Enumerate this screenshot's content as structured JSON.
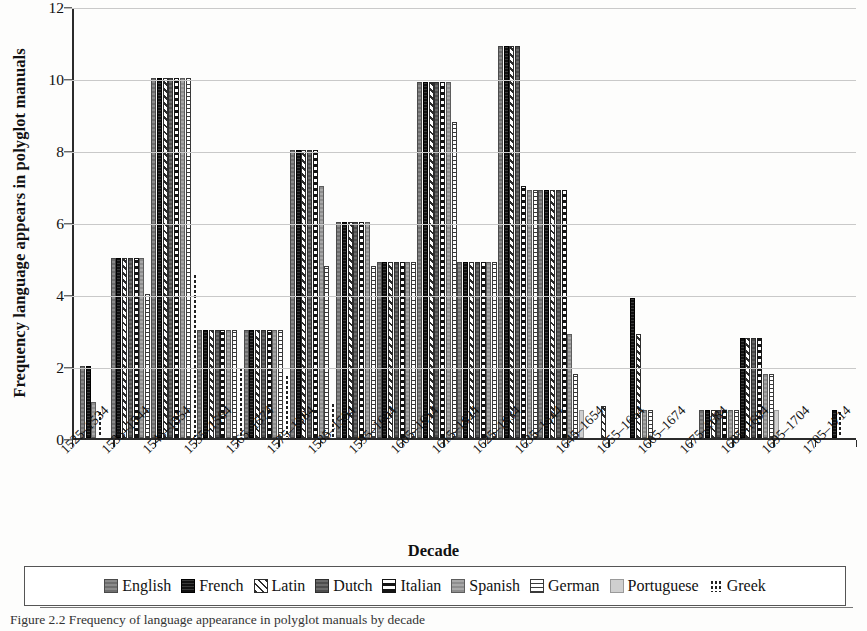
{
  "figure": {
    "caption": "Figure 2.2 Frequency of language appearance in polyglot manuals by decade",
    "xaxis_title": "Decade",
    "yaxis_title": "Frequency language appears in polyglot manuals"
  },
  "legend": {
    "items": [
      {
        "label": "English",
        "swatch": "solid-medium-gray-swatch",
        "color": "#7c7c7c"
      },
      {
        "label": "French",
        "swatch": "solid-black-swatch",
        "color": "#1e1e1e"
      },
      {
        "label": "Latin",
        "swatch": "diagonal-hatch-swatch",
        "color": "#2d2d2d"
      },
      {
        "label": "Dutch",
        "swatch": "solid-dark-gray-swatch",
        "color": "#5a5a5a"
      },
      {
        "label": "Italian",
        "swatch": "horizontal-band-swatch",
        "color": "#151515"
      },
      {
        "label": "Spanish",
        "swatch": "solid-gray-swatch",
        "color": "#9a9a9a"
      },
      {
        "label": "German",
        "swatch": "horizontal-line-swatch",
        "color": "#3a3a3a"
      },
      {
        "label": "Portuguese",
        "swatch": "solid-light-gray-swatch",
        "color": "#cfcfcf"
      },
      {
        "label": "Greek",
        "swatch": "dotted-swatch",
        "color": "#222222"
      }
    ]
  },
  "chart_data": {
    "type": "bar",
    "title": "",
    "xlabel": "Decade",
    "ylabel": "Frequency language appears in polyglot manuals",
    "ylim": [
      0,
      12
    ],
    "yticks": [
      0,
      2,
      4,
      6,
      8,
      10,
      12
    ],
    "grid": true,
    "legend_position": "bottom",
    "categories": [
      "1525–1534",
      "1535–1544",
      "1545–1554",
      "1555–1564",
      "1565–1574",
      "1575–1584",
      "1585–1594",
      "1595–1604",
      "1605–1614",
      "1615–1624",
      "1625–1634",
      "1635–1644",
      "1645–1654",
      "1655–1664",
      "1665–1674",
      "1675–1684",
      "1685–1694",
      "1695–1704",
      "1705–1714"
    ],
    "series": [
      {
        "name": "English",
        "values": [
          2,
          5,
          10,
          3,
          3,
          8,
          6,
          4.9,
          9.9,
          4.9,
          10.9,
          6.9,
          0,
          0,
          0,
          0.8,
          0,
          0,
          0
        ]
      },
      {
        "name": "French",
        "values": [
          2,
          5,
          10,
          3,
          3,
          8,
          6,
          4.9,
          9.9,
          4.9,
          10.9,
          6.9,
          0,
          3.9,
          0,
          0.8,
          2.8,
          0,
          0.8
        ]
      },
      {
        "name": "Latin",
        "values": [
          0,
          5,
          10,
          3,
          3,
          8,
          6,
          4.9,
          9.9,
          4.9,
          10.9,
          6.9,
          0.9,
          2.9,
          0,
          0.8,
          2.8,
          0,
          0
        ]
      },
      {
        "name": "Dutch",
        "values": [
          0,
          5,
          10,
          3,
          3,
          8,
          6,
          4.9,
          9.9,
          4.9,
          10.9,
          6.9,
          0,
          0,
          0,
          0.8,
          2.8,
          0,
          0
        ]
      },
      {
        "name": "Italian",
        "values": [
          0,
          5,
          10,
          3,
          3,
          8,
          6,
          4.9,
          9.9,
          4.9,
          7.0,
          6.9,
          0,
          0,
          0,
          0.8,
          2.8,
          0,
          0
        ]
      },
      {
        "name": "Spanish",
        "values": [
          1,
          5,
          10,
          3,
          3,
          7,
          6,
          4.9,
          9.9,
          4.9,
          6.9,
          2.9,
          0,
          0.8,
          0,
          0.8,
          1.8,
          0,
          0
        ]
      },
      {
        "name": "German",
        "values": [
          0,
          4,
          10,
          3,
          3,
          4.8,
          4.8,
          4.9,
          8.8,
          4.9,
          6.9,
          1.8,
          0,
          0.8,
          0,
          0.8,
          1.8,
          0,
          0
        ]
      },
      {
        "name": "Portuguese",
        "values": [
          0,
          0,
          0,
          0,
          0,
          0,
          0,
          0,
          0,
          0,
          0,
          0.8,
          0,
          0,
          0,
          0,
          0.8,
          0,
          0
        ]
      },
      {
        "name": "Greek",
        "values": [
          0.8,
          0,
          4.6,
          2.0,
          1.8,
          1.0,
          0,
          0,
          0,
          0,
          0,
          0,
          0,
          0,
          0,
          0,
          0,
          0,
          0.8
        ]
      }
    ]
  }
}
